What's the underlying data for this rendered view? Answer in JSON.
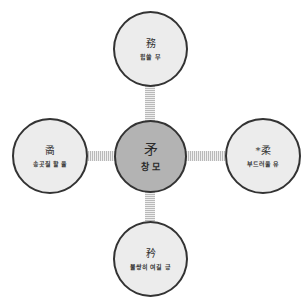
{
  "diagram": {
    "type": "radial-hub-and-spoke",
    "colors": {
      "center_fill": "#b3b3b3",
      "outer_fill": "#ececec",
      "border": "#333333",
      "connector": "#b9b9b9"
    },
    "center": {
      "hanja": "矛",
      "meaning": "창 모"
    },
    "nodes": {
      "top": {
        "hanja": "務",
        "meaning": "힘쓸 무"
      },
      "left": {
        "hanja": "矞",
        "meaning": "송곳질 할 율"
      },
      "right": {
        "hanja": "*柔",
        "meaning": "부드러울 유"
      },
      "bottom": {
        "hanja": "矜",
        "meaning": "불쌍히 여길 긍"
      }
    }
  }
}
